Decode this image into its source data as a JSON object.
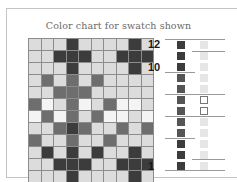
{
  "title": "Color chart for swatch shown",
  "colors": {
    "L": "#dcdcdc",
    "W": "#f4f4f4",
    "M": "#6e6e6e",
    "D": "#3c3c3c"
  },
  "chart_data": {
    "type": "heatmap",
    "title": "Color chart for swatch shown",
    "columns": 10,
    "rows_top_to_bottom": [
      {
        "row": 12,
        "cells": [
          "L",
          "L",
          "L",
          "D",
          "L",
          "L",
          "L",
          "L",
          "D",
          "L"
        ]
      },
      {
        "row": 11,
        "cells": [
          "L",
          "L",
          "D",
          "D",
          "D",
          "L",
          "L",
          "D",
          "D",
          "D"
        ]
      },
      {
        "row": 10,
        "cells": [
          "L",
          "L",
          "L",
          "D",
          "L",
          "L",
          "L",
          "L",
          "D",
          "L"
        ]
      },
      {
        "row": 9,
        "cells": [
          "L",
          "M",
          "L",
          "M",
          "L",
          "M",
          "L",
          "L",
          "L",
          "L"
        ]
      },
      {
        "row": 8,
        "cells": [
          "L",
          "L",
          "M",
          "M",
          "M",
          "L",
          "L",
          "L",
          "L",
          "L"
        ]
      },
      {
        "row": 7,
        "cells": [
          "M",
          "W",
          "L",
          "M",
          "W",
          "L",
          "M",
          "W",
          "W",
          "L"
        ]
      },
      {
        "row": 6,
        "cells": [
          "W",
          "M",
          "W",
          "M",
          "L",
          "M",
          "W",
          "W",
          "L",
          "W"
        ]
      },
      {
        "row": 5,
        "cells": [
          "L",
          "L",
          "M",
          "D",
          "M",
          "L",
          "L",
          "M",
          "L",
          "M"
        ]
      },
      {
        "row": 4,
        "cells": [
          "M",
          "L",
          "L",
          "M",
          "L",
          "L",
          "M",
          "L",
          "L",
          "L"
        ]
      },
      {
        "row": 3,
        "cells": [
          "L",
          "D",
          "L",
          "D",
          "L",
          "D",
          "L",
          "L",
          "D",
          "L"
        ]
      },
      {
        "row": 2,
        "cells": [
          "L",
          "L",
          "D",
          "D",
          "D",
          "L",
          "L",
          "D",
          "D",
          "D"
        ]
      },
      {
        "row": 1,
        "cells": [
          "L",
          "L",
          "L",
          "D",
          "L",
          "L",
          "L",
          "L",
          "D",
          "L"
        ]
      }
    ],
    "row_labels": [
      {
        "label": "12",
        "row": 12
      },
      {
        "label": "10",
        "row": 10
      },
      {
        "label": "1",
        "row": 1
      }
    ],
    "legend": {
      "L": "light gray",
      "W": "white",
      "M": "medium gray",
      "D": "dark gray"
    }
  },
  "key_column": {
    "dark_swatches": 12,
    "light_swatches": 12
  }
}
